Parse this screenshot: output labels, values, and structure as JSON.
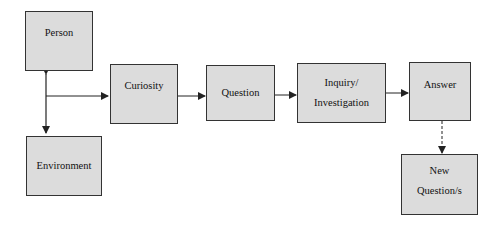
{
  "diagram": {
    "nodes": [
      {
        "id": "person",
        "label": "Person"
      },
      {
        "id": "environment",
        "label": "Environment"
      },
      {
        "id": "curiosity",
        "label": "Curiosity"
      },
      {
        "id": "question",
        "label": "Question"
      },
      {
        "id": "inquiry",
        "label_line1": "Inquiry/",
        "label_line2": "Investigation"
      },
      {
        "id": "answer",
        "label": "Answer"
      },
      {
        "id": "new_questions",
        "label_line1": "New",
        "label_line2": "Question/s"
      }
    ],
    "edges": [
      {
        "from": "person",
        "to": "environment",
        "style": "solid",
        "bidirectional": true
      },
      {
        "from": "person-environment",
        "to": "curiosity",
        "style": "solid"
      },
      {
        "from": "curiosity",
        "to": "question",
        "style": "solid"
      },
      {
        "from": "question",
        "to": "inquiry",
        "style": "solid"
      },
      {
        "from": "inquiry",
        "to": "answer",
        "style": "solid"
      },
      {
        "from": "answer",
        "to": "new_questions",
        "style": "dashed"
      }
    ],
    "colors": {
      "box_fill": "#dcdcdc",
      "border": "#333333",
      "line": "#222222"
    }
  }
}
